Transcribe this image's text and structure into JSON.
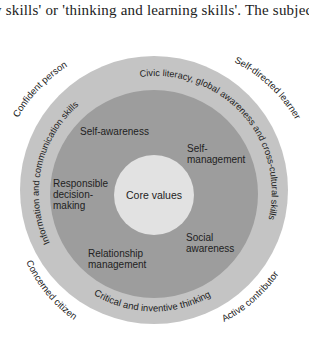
{
  "header_text": "y skills' or 'thinking and learning skills'. The subjec",
  "diagram": {
    "type": "concentric-circles",
    "colors": {
      "outer_ring": "#c4c4c4",
      "middle_ring": "#9d9d9d",
      "core": "#e2e2e2",
      "text": "#222222"
    },
    "core": {
      "label": "Core values"
    },
    "middle_ring": {
      "labels": [
        "Self-awareness",
        "Self-",
        "management",
        "Responsible",
        "decision-",
        "making",
        "Social",
        "awareness",
        "Relationship",
        "management"
      ]
    },
    "outer_ring": {
      "arcs": [
        "Civic literacy, global awareness and cross-cultural skills",
        "Critical and inventive thinking",
        "Information and communication skills"
      ]
    },
    "outcomes": [
      "Confident person",
      "Self-directed learner",
      "Concerned citizen",
      "Active contributor"
    ]
  }
}
